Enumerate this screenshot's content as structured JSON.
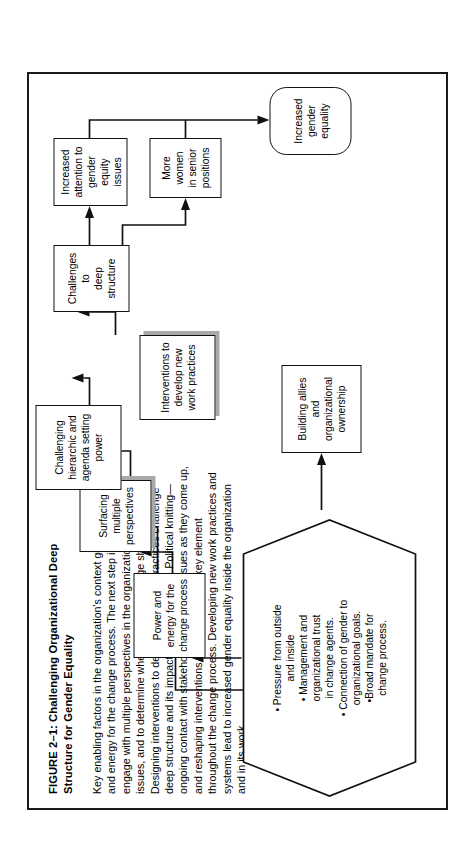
{
  "figure": {
    "caption_title": "FIGURE 2–1: Challenging Organizational Deep Structure for Gender Equality",
    "caption_paragraph_1": "Key enabling factors in the organization's context generate the power and energy for the change process. The next step is to uncover and engage with multiple perspectives in the organization on gender issues, and to determine where and how change should start.",
    "caption_paragraph_2": "Designing interventions to develop new work practices challenge deep structure and its impact on gender equity.  Political knitting—ongoing contact with stakeholders, resolving issues as they come up, and reshaping interventions as required—is a key element throughout the change process.  Developing new work practices and systems lead to increased gender equality inside the organization and in its work."
  },
  "diagram": {
    "type": "flowchart",
    "nodes": [
      {
        "id": "enablers",
        "label": "• Pressure from outside\nand inside\n• Management and\norganizational trust\nin change agents.\n• Connection of gender to\norganizational goals.\n•Broad mandate for\nchange process.",
        "shape": "hexagon"
      },
      {
        "id": "power",
        "label": "Power and\nenergy for the\nchange process",
        "shape": "rect"
      },
      {
        "id": "surfacing",
        "label": "Surfacing\nmultiple\nperspectives",
        "shape": "rect-shadow"
      },
      {
        "id": "allies",
        "label": "Building allies and\norganizational\nownership",
        "shape": "rect"
      },
      {
        "id": "hierarchy",
        "label": "Challenging\nhierarchic and\nagenda setting\npower",
        "shape": "rect"
      },
      {
        "id": "interventions",
        "label": "Interventions to\ndevelop new\nwork practices",
        "shape": "rect-shadow"
      },
      {
        "id": "challenges",
        "label": "Challenges to\ndeep structure",
        "shape": "rect"
      },
      {
        "id": "attention",
        "label": "Increased\nattention to\ngender equity\nissues",
        "shape": "rect"
      },
      {
        "id": "women",
        "label": "More women\nin senior\npositions",
        "shape": "rect"
      },
      {
        "id": "equality",
        "label": "Increased\ngender\nequality",
        "shape": "rounded"
      }
    ],
    "edges": [
      {
        "from": "enablers",
        "to": "power"
      },
      {
        "from": "allies",
        "to": "power"
      },
      {
        "from": "power",
        "to": "surfacing"
      },
      {
        "from": "power",
        "to": "hierarchy"
      },
      {
        "from": "surfacing",
        "to": "allies"
      },
      {
        "from": "surfacing",
        "to": "interventions"
      },
      {
        "from": "hierarchy",
        "to": "interventions"
      },
      {
        "from": "interventions",
        "to": "challenges"
      },
      {
        "from": "challenges",
        "to": "attention"
      },
      {
        "from": "challenges",
        "to": "women"
      },
      {
        "from": "attention",
        "to": "equality"
      },
      {
        "from": "women",
        "to": "equality"
      }
    ]
  },
  "colors": {
    "line": "#111111",
    "shadow": "#a9a9a9",
    "frame": "#1a1a1a",
    "background": "#ffffff"
  }
}
